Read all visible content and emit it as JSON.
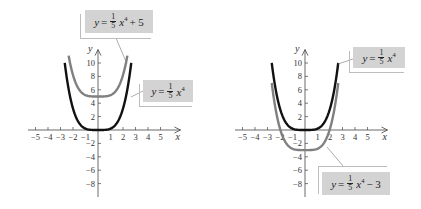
{
  "chart_data": [
    {
      "type": "line",
      "title": "",
      "xlabel": "x",
      "ylabel": "y",
      "xlim": [
        -5,
        5
      ],
      "ylim": [
        -9,
        11
      ],
      "x_ticks": [
        -5,
        -4,
        -3,
        -2,
        -1,
        1,
        2,
        3,
        4,
        5
      ],
      "y_ticks": [
        -8,
        -6,
        -4,
        -2,
        2,
        4,
        6,
        8,
        10
      ],
      "grid": false,
      "series": [
        {
          "name": "y = 1/5 x^4 + 5",
          "color": "#808080",
          "function": "0.2*x^4+5",
          "x_range": [
            -2.35,
            2.35
          ]
        },
        {
          "name": "y = 1/5 x^4",
          "color": "#111111",
          "function": "0.2*x^4",
          "x_range": [
            -2.66,
            2.66
          ]
        }
      ]
    },
    {
      "type": "line",
      "title": "",
      "xlabel": "x",
      "ylabel": "y",
      "xlim": [
        -5,
        5
      ],
      "ylim": [
        -9,
        11
      ],
      "x_ticks": [
        -5,
        -4,
        -3,
        -2,
        -1,
        1,
        2,
        3,
        4,
        5
      ],
      "y_ticks": [
        -8,
        -6,
        -4,
        -2,
        2,
        4,
        6,
        8,
        10
      ],
      "grid": false,
      "series": [
        {
          "name": "y = 1/5 x^4",
          "color": "#111111",
          "function": "0.2*x^4",
          "x_range": [
            -2.66,
            2.66
          ]
        },
        {
          "name": "y = 1/5 x^4 - 3",
          "color": "#808080",
          "function": "0.2*x^4-3",
          "x_range": [
            -2.66,
            2.66
          ]
        }
      ]
    }
  ],
  "left": {
    "labels": {
      "shifted": {
        "lhs": "y",
        "eq": "=",
        "num": "1",
        "den": "5",
        "var": "x",
        "exp": "4",
        "tail": "+ 5"
      },
      "base": {
        "lhs": "y",
        "eq": "=",
        "num": "1",
        "den": "5",
        "var": "x",
        "exp": "4",
        "tail": ""
      }
    }
  },
  "right": {
    "labels": {
      "base": {
        "lhs": "y",
        "eq": "=",
        "num": "1",
        "den": "5",
        "var": "x",
        "exp": "4",
        "tail": ""
      },
      "shifted": {
        "lhs": "y",
        "eq": "=",
        "num": "1",
        "den": "5",
        "var": "x",
        "exp": "4",
        "tail": "− 3"
      }
    }
  },
  "axis": {
    "x": "x",
    "y": "y"
  },
  "colors": {
    "base_curve": "#111111",
    "shifted_curve": "#808080",
    "label_fill": "#d3d3d3"
  }
}
